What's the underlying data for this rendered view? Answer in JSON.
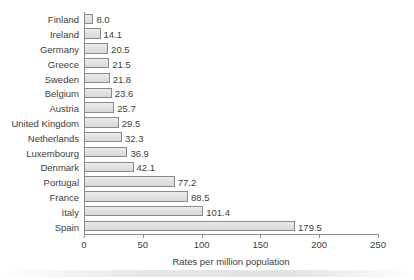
{
  "chart_data": {
    "type": "bar",
    "orientation": "horizontal",
    "title": "",
    "xlabel": "Rates per million population",
    "ylabel": "",
    "xlim": [
      0,
      250
    ],
    "xticks": [
      0,
      50,
      100,
      150,
      200,
      250
    ],
    "grid": false,
    "legend": null,
    "value_labels": true,
    "categories": [
      "Finland",
      "Ireland",
      "Germany",
      "Greece",
      "Sweden",
      "Belgium",
      "Austria",
      "United Kingdom",
      "Netherlands",
      "Luxembourg",
      "Denmark",
      "Portugal",
      "France",
      "Italy",
      "Spain"
    ],
    "values": [
      8.0,
      14.1,
      20.5,
      21.5,
      21.8,
      23.6,
      25.7,
      29.5,
      32.3,
      36.9,
      42.1,
      77.2,
      88.5,
      101.4,
      179.5
    ],
    "value_label_texts": [
      "8.0",
      "14.1",
      "20.5",
      "21.5",
      "21.8",
      "23.6",
      "25.7",
      "29.5",
      "32.3",
      "36.9",
      "42.1",
      "77.2",
      "88.5",
      "101.4",
      "179.5"
    ],
    "xtick_labels": [
      "0",
      "50",
      "100",
      "150",
      "200",
      "250"
    ],
    "colors": {
      "bar_fill": "#e3e3e3",
      "bar_edge": "#8a8a8a",
      "axis": "#8d8d8d",
      "text": "#3d3d3d",
      "background": "#ffffff"
    }
  }
}
